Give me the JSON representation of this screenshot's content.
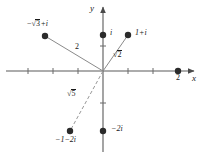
{
  "figure": {
    "type": "complex-plane-diagram",
    "background_color": "#ffffff",
    "ink_color": "#1a1a1a",
    "origin_px": [
      103,
      71
    ],
    "unit_px": 25,
    "axes": {
      "x_label": "x",
      "y_label": "y",
      "x_ticks": [
        -3,
        -2,
        -1,
        1,
        2,
        3
      ],
      "y_ticks": [
        -1,
        1,
        2
      ]
    },
    "points": [
      {
        "id": "p-sqrt3-plus-i",
        "label": "−√3+i",
        "label_parts": {
          "sign": "−",
          "radicand": "3",
          "rest": "+i"
        },
        "x_px": 45,
        "y_px": 36,
        "label_x": 27,
        "label_y": 19
      },
      {
        "id": "p-i",
        "label": "i",
        "x_px": 103,
        "y_px": 35,
        "label_x": 110,
        "label_y": 29
      },
      {
        "id": "p-1-plus-i",
        "label": "1+i",
        "x_px": 128,
        "y_px": 35,
        "label_x": 135,
        "label_y": 29
      },
      {
        "id": "p-2",
        "label": "2",
        "x_px": 178,
        "y_px": 71,
        "label_x": 176,
        "label_y": 74
      },
      {
        "id": "p-minus-2i",
        "label": "−2i",
        "x_px": 103,
        "y_px": 131,
        "label_x": 111,
        "label_y": 125
      },
      {
        "id": "p-minus-1-minus-2i",
        "label": "−1−2i",
        "x_px": 70,
        "y_px": 131,
        "label_x": 55,
        "label_y": 136
      }
    ],
    "segments": [
      {
        "id": "seg-modulus-2",
        "from_px": [
          103,
          71
        ],
        "to_px": [
          45,
          36
        ],
        "label": "2",
        "label_x": 75,
        "label_y": 43
      },
      {
        "id": "seg-modulus-sqrt2",
        "from_px": [
          103,
          71
        ],
        "to_px": [
          128,
          35
        ],
        "label": "√2",
        "radicand": "2",
        "label_x": 113,
        "label_y": 50
      },
      {
        "id": "seg-modulus-sqrt5",
        "from_px": [
          103,
          71
        ],
        "to_px": [
          70,
          131
        ],
        "label": "√5",
        "radicand": "5",
        "label_x": 67,
        "label_y": 89
      }
    ]
  }
}
